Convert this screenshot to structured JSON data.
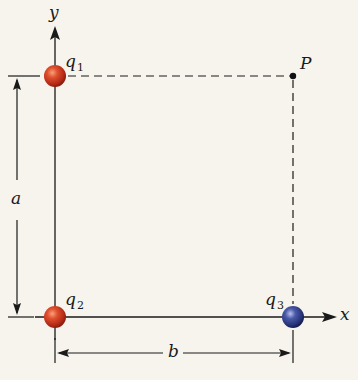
{
  "diagram": {
    "axes": {
      "x_label": "x",
      "y_label": "y"
    },
    "charges": [
      {
        "id": "q1",
        "label": "q",
        "subscript": "1",
        "color": "#c8321e",
        "position": "top-left corner"
      },
      {
        "id": "q2",
        "label": "q",
        "subscript": "2",
        "color": "#c8321e",
        "position": "origin"
      },
      {
        "id": "q3",
        "label": "q",
        "subscript": "3",
        "color": "#2b3a8a",
        "position": "on x-axis"
      }
    ],
    "point": {
      "label": "P",
      "position": "top-right corner"
    },
    "dimensions": {
      "vertical": "a",
      "horizontal": "b"
    },
    "colors": {
      "background": "#f6f4ec",
      "line": "#1a1a1a",
      "positive_charge": "#c8321e",
      "negative_charge": "#2b3a8a"
    }
  }
}
